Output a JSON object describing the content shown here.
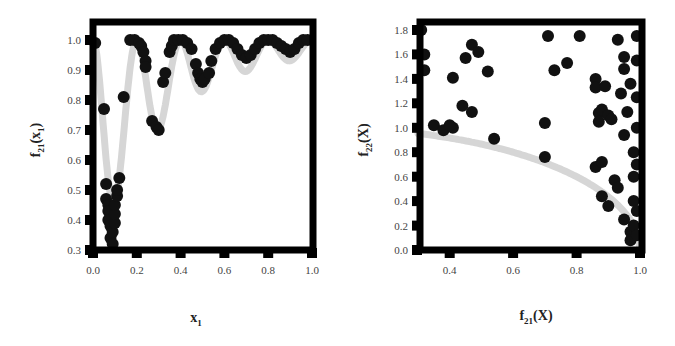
{
  "chart_data": [
    {
      "type": "scatter",
      "title": "",
      "xlabel": "x_1",
      "ylabel": "f_21(x_1)",
      "xlabel_main": "x",
      "xlabel_sub": "1",
      "ylabel_main": "f",
      "ylabel_sub": "21",
      "ylabel_paren": "(x",
      "ylabel_paren_sub": "1",
      "ylabel_close": ")",
      "xlim": [
        0.0,
        1.0
      ],
      "ylim": [
        0.3,
        1.0
      ],
      "xticks": [
        "0.0",
        "0.2",
        "0.4",
        "0.6",
        "0.8",
        "1.0"
      ],
      "yticks": [
        "0.3",
        "0.4",
        "0.5",
        "0.6",
        "0.7",
        "0.8",
        "0.9",
        "1.0"
      ],
      "grid": false,
      "legend": null,
      "reference_curve": {
        "name": "true front",
        "color": "#d9d9d9",
        "description": "oscillating curve with deep minima near x1=0.1 and x1=0.3, smaller dips near 0.5, 0.7, 0.9"
      },
      "series": [
        {
          "name": "solutions",
          "color": "#111111",
          "points": [
            [
              0.01,
              0.99
            ],
            [
              0.05,
              0.77
            ],
            [
              0.06,
              0.52
            ],
            [
              0.06,
              0.47
            ],
            [
              0.07,
              0.45
            ],
            [
              0.07,
              0.43
            ],
            [
              0.07,
              0.4
            ],
            [
              0.08,
              0.38
            ],
            [
              0.08,
              0.34
            ],
            [
              0.09,
              0.32
            ],
            [
              0.09,
              0.36
            ],
            [
              0.1,
              0.39
            ],
            [
              0.1,
              0.42
            ],
            [
              0.1,
              0.45
            ],
            [
              0.11,
              0.48
            ],
            [
              0.11,
              0.5
            ],
            [
              0.12,
              0.54
            ],
            [
              0.14,
              0.81
            ],
            [
              0.17,
              1.0
            ],
            [
              0.19,
              1.0
            ],
            [
              0.21,
              0.99
            ],
            [
              0.22,
              0.98
            ],
            [
              0.23,
              0.96
            ],
            [
              0.24,
              0.93
            ],
            [
              0.24,
              0.91
            ],
            [
              0.27,
              0.73
            ],
            [
              0.29,
              0.71
            ],
            [
              0.3,
              0.7
            ],
            [
              0.32,
              0.86
            ],
            [
              0.33,
              0.89
            ],
            [
              0.35,
              0.96
            ],
            [
              0.36,
              0.98
            ],
            [
              0.37,
              1.0
            ],
            [
              0.39,
              1.0
            ],
            [
              0.41,
              1.0
            ],
            [
              0.43,
              0.99
            ],
            [
              0.45,
              0.97
            ],
            [
              0.47,
              0.92
            ],
            [
              0.48,
              0.89
            ],
            [
              0.49,
              0.87
            ],
            [
              0.5,
              0.86
            ],
            [
              0.51,
              0.87
            ],
            [
              0.53,
              0.89
            ],
            [
              0.54,
              0.93
            ],
            [
              0.56,
              0.97
            ],
            [
              0.58,
              0.99
            ],
            [
              0.6,
              1.0
            ],
            [
              0.62,
              1.0
            ],
            [
              0.64,
              0.99
            ],
            [
              0.66,
              0.97
            ],
            [
              0.68,
              0.95
            ],
            [
              0.7,
              0.94
            ],
            [
              0.72,
              0.95
            ],
            [
              0.74,
              0.97
            ],
            [
              0.76,
              0.99
            ],
            [
              0.78,
              1.0
            ],
            [
              0.8,
              1.0
            ],
            [
              0.82,
              1.0
            ],
            [
              0.84,
              0.99
            ],
            [
              0.86,
              0.98
            ],
            [
              0.88,
              0.97
            ],
            [
              0.9,
              0.96
            ],
            [
              0.92,
              0.97
            ],
            [
              0.94,
              0.99
            ],
            [
              0.96,
              1.0
            ],
            [
              0.98,
              1.0
            ]
          ]
        }
      ]
    },
    {
      "type": "scatter",
      "title": "",
      "xlabel": "f_21(X)",
      "ylabel": "f_22(X)",
      "xlabel_main": "f",
      "xlabel_sub": "21",
      "xlabel_rest": "(X)",
      "ylabel_main": "f",
      "ylabel_sub": "22",
      "ylabel_rest": "(X)",
      "xlim": [
        0.3,
        1.0
      ],
      "ylim": [
        0.0,
        1.8
      ],
      "xticks": [
        "0.4",
        "0.6",
        "0.8",
        "1.0"
      ],
      "yticks": [
        "0.0",
        "0.2",
        "0.4",
        "0.6",
        "0.8",
        "1.0",
        "1.2",
        "1.4",
        "1.6",
        "1.8"
      ],
      "grid": false,
      "legend": null,
      "reference_curve": {
        "name": "pareto front",
        "color": "#d9d9d9",
        "description": "concave arc y = sqrt(1 - x^2) from (0.3, ~0.97) to (1.0, 0.0)"
      },
      "series": [
        {
          "name": "solutions",
          "color": "#111111",
          "points": [
            [
              0.31,
              1.8
            ],
            [
              0.32,
              1.6
            ],
            [
              0.32,
              1.47
            ],
            [
              0.35,
              1.02
            ],
            [
              0.38,
              0.98
            ],
            [
              0.41,
              1.0
            ],
            [
              0.4,
              1.02
            ],
            [
              0.41,
              1.41
            ],
            [
              0.44,
              1.18
            ],
            [
              0.45,
              1.57
            ],
            [
              0.47,
              1.68
            ],
            [
              0.47,
              1.13
            ],
            [
              0.49,
              1.62
            ],
            [
              0.52,
              1.46
            ],
            [
              0.54,
              0.91
            ],
            [
              0.7,
              1.04
            ],
            [
              0.7,
              0.76
            ],
            [
              0.71,
              1.75
            ],
            [
              0.73,
              1.47
            ],
            [
              0.77,
              1.53
            ],
            [
              0.81,
              1.75
            ],
            [
              0.86,
              1.4
            ],
            [
              0.86,
              1.33
            ],
            [
              0.87,
              1.12
            ],
            [
              0.87,
              1.05
            ],
            [
              0.88,
              1.15
            ],
            [
              0.89,
              1.34
            ],
            [
              0.9,
              1.1
            ],
            [
              0.91,
              1.07
            ],
            [
              0.86,
              0.68
            ],
            [
              0.88,
              0.72
            ],
            [
              0.88,
              0.44
            ],
            [
              0.9,
              0.36
            ],
            [
              0.92,
              0.57
            ],
            [
              0.93,
              0.51
            ],
            [
              0.93,
              1.72
            ],
            [
              0.94,
              1.28
            ],
            [
              0.95,
              1.58
            ],
            [
              0.95,
              1.48
            ],
            [
              0.95,
              0.94
            ],
            [
              0.96,
              1.13
            ],
            [
              0.95,
              0.25
            ],
            [
              0.97,
              1.36
            ],
            [
              0.97,
              0.15
            ],
            [
              0.97,
              0.08
            ],
            [
              0.98,
              0.8
            ],
            [
              0.98,
              0.6
            ],
            [
              0.98,
              0.4
            ],
            [
              0.98,
              0.2
            ],
            [
              0.99,
              1.75
            ],
            [
              0.99,
              1.55
            ],
            [
              0.99,
              1.25
            ],
            [
              0.99,
              1.0
            ],
            [
              0.99,
              0.7
            ],
            [
              0.99,
              0.32
            ],
            [
              0.99,
              0.12
            ]
          ]
        }
      ]
    }
  ]
}
